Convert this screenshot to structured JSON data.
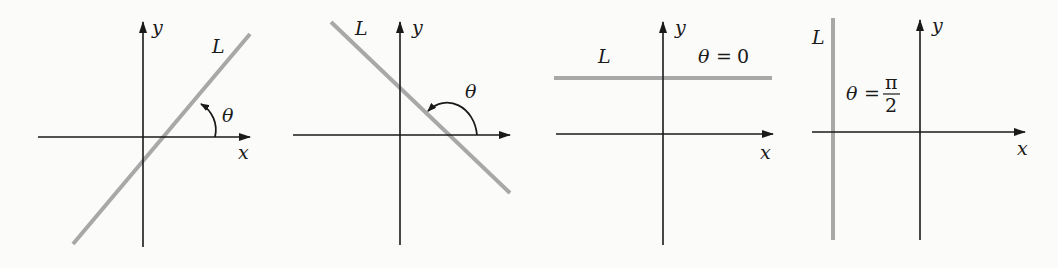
{
  "figure": {
    "panels": [
      {
        "id": "positive-slope",
        "line_label": "L",
        "x_label": "x",
        "y_label": "y",
        "angle_label": "θ",
        "angle_description": "acute angle from positive x-axis to L"
      },
      {
        "id": "negative-slope",
        "line_label": "L",
        "x_label": "",
        "y_label": "y",
        "angle_label": "θ",
        "angle_description": "obtuse angle from positive x-axis to L"
      },
      {
        "id": "horizontal-line",
        "line_label": "L",
        "x_label": "x",
        "y_label": "y",
        "angle_label": "θ",
        "angle_equals": "=",
        "angle_value": "0"
      },
      {
        "id": "vertical-line",
        "line_label": "L",
        "x_label": "x",
        "y_label": "y",
        "angle_label": "θ",
        "angle_equals": "=",
        "angle_numerator": "π",
        "angle_denominator": "2"
      }
    ],
    "colors": {
      "axis": "#1a1a1a",
      "line_L": "#a8a8a8",
      "background": "#fbfbf9"
    }
  }
}
